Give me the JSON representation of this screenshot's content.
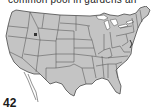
{
  "caption": {
    "text": "common pool in gardens an"
  },
  "map": {
    "title": "Contiguous United States",
    "fill_color": "#c4c4c4",
    "border_color": "#4a4a4a",
    "water_color": "#ffffff"
  },
  "page": {
    "number": "42"
  }
}
